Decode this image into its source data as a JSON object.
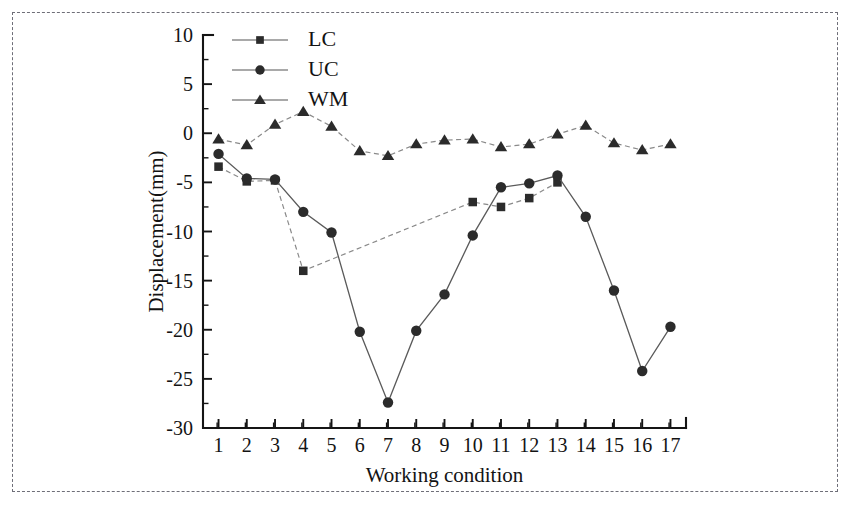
{
  "chart_data": {
    "type": "line",
    "title": "",
    "xlabel": "Working condition",
    "ylabel": "Displacement(mm)",
    "xlim": [
      0.45,
      17.55
    ],
    "ylim": [
      -30,
      10
    ],
    "ytick_step": 5,
    "yticks": [
      10,
      5,
      0,
      -5,
      -10,
      -15,
      -20,
      -25,
      -30
    ],
    "ytick_labels": [
      "10",
      "5",
      "0",
      "-5",
      "-10",
      "-15",
      "-20",
      "-25",
      "-30"
    ],
    "xticks": [
      1,
      2,
      3,
      4,
      5,
      6,
      7,
      8,
      9,
      10,
      11,
      12,
      13,
      14,
      15,
      16,
      17
    ],
    "xtick_labels": [
      "1",
      "2",
      "3",
      "4",
      "5",
      "6",
      "7",
      "8",
      "9",
      "10",
      "11",
      "12",
      "13",
      "14",
      "15",
      "16",
      "17"
    ],
    "minor_ticks": true,
    "grid": false,
    "legend_position": "top-left-inside",
    "categories": [
      1,
      2,
      3,
      4,
      5,
      6,
      7,
      8,
      9,
      10,
      11,
      12,
      13,
      14,
      15,
      16,
      17
    ],
    "series": [
      {
        "name": "LC",
        "marker": "square",
        "linestyle": "dashed",
        "x": [
          1,
          2,
          3,
          4,
          10,
          11,
          12,
          13
        ],
        "values": [
          -3.4,
          -4.9,
          -4.8,
          -14.0,
          -7.0,
          -7.5,
          -6.6,
          -5.0
        ]
      },
      {
        "name": "UC",
        "marker": "circle",
        "linestyle": "solid",
        "x": [
          1,
          2,
          3,
          4,
          5,
          6,
          7,
          8,
          9,
          10,
          11,
          12,
          13,
          14,
          15,
          16,
          17
        ],
        "values": [
          -2.1,
          -4.6,
          -4.7,
          -8.0,
          -10.1,
          -20.2,
          -27.4,
          -20.1,
          -16.4,
          -10.4,
          -5.5,
          -5.1,
          -4.3,
          -8.5,
          -16.0,
          -24.2,
          -19.7
        ]
      },
      {
        "name": "WM",
        "marker": "triangle",
        "linestyle": "dashed",
        "x": [
          1,
          2,
          3,
          4,
          5,
          6,
          7,
          8,
          9,
          10,
          11,
          12,
          13,
          14,
          15,
          16,
          17
        ],
        "values": [
          -0.6,
          -1.2,
          0.9,
          2.2,
          0.7,
          -1.8,
          -2.3,
          -1.1,
          -0.7,
          -0.6,
          -1.4,
          -1.1,
          -0.1,
          0.8,
          -1.0,
          -1.7,
          -1.1
        ]
      }
    ],
    "legend": [
      {
        "label": "LC",
        "marker": "square",
        "linestyle": "solid"
      },
      {
        "label": "UC",
        "marker": "circle",
        "linestyle": "solid"
      },
      {
        "label": "WM",
        "marker": "triangle",
        "linestyle": "solid"
      }
    ],
    "colors": {
      "series": "#2b2b2b",
      "line": "#777777",
      "axis": "#151515",
      "background": "#ffffff",
      "border": "#6e6e78"
    }
  }
}
